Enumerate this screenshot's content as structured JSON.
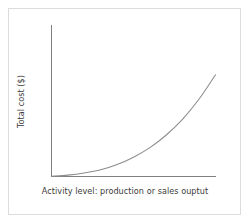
{
  "figure": {
    "background_color": "#ffffff",
    "frame_color": "#dcdcdc",
    "axis_color": "#808080",
    "curve_color": "#8c8c8c",
    "text_color": "#3b3b3b"
  },
  "chart_data": {
    "type": "line",
    "title": "",
    "subtitle": "",
    "xlabel": "Activity level: production or sales ouptut",
    "ylabel": "Total cost ($)",
    "xlim": [
      0,
      100
    ],
    "ylim": [
      0,
      100
    ],
    "grid": false,
    "legend": null,
    "xticks": [],
    "yticks": [],
    "xticklabels": [],
    "yticklabels": [],
    "annotations": [],
    "series": [
      {
        "name": "Total cost",
        "description": "Curvilinear (convex, exponentially rising) cost curve starting at the origin and hugging the x-axis before rising steeply",
        "x": [
          0,
          10,
          20,
          30,
          40,
          50,
          60,
          70,
          80,
          90,
          100
        ],
        "y": [
          0,
          1,
          3,
          6,
          11,
          18,
          27,
          39,
          54,
          73,
          96
        ]
      }
    ]
  }
}
